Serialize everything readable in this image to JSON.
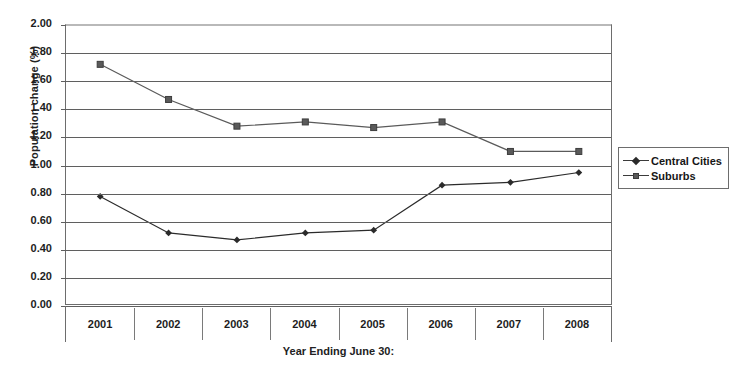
{
  "chart_data": {
    "type": "line",
    "title": "",
    "xlabel": "Year Ending June 30:",
    "ylabel": "Population change (%)",
    "categories": [
      "2001",
      "2002",
      "2003",
      "2004",
      "2005",
      "2006",
      "2007",
      "2008"
    ],
    "ylim": [
      0.0,
      2.0
    ],
    "ytick_step": 0.2,
    "ytick_labels": [
      "2.00",
      "1.80",
      "1.60",
      "1.40",
      "1.20",
      "1.00",
      "0.80",
      "0.60",
      "0.40",
      "0.20",
      "0.00"
    ],
    "grid": true,
    "legend_position": "right",
    "series": [
      {
        "name": "Central Cities",
        "marker": "diamond",
        "color": "#2b2b2b",
        "values": [
          0.78,
          0.52,
          0.47,
          0.52,
          0.54,
          0.86,
          0.88,
          0.95
        ]
      },
      {
        "name": "Suburbs",
        "marker": "square",
        "color": "#5a5a5a",
        "values": [
          1.72,
          1.47,
          1.28,
          1.31,
          1.27,
          1.31,
          1.1,
          1.1
        ]
      }
    ]
  },
  "legend": {
    "items": [
      {
        "label": "Central Cities",
        "marker": "diamond"
      },
      {
        "label": "Suburbs",
        "marker": "square"
      }
    ]
  }
}
